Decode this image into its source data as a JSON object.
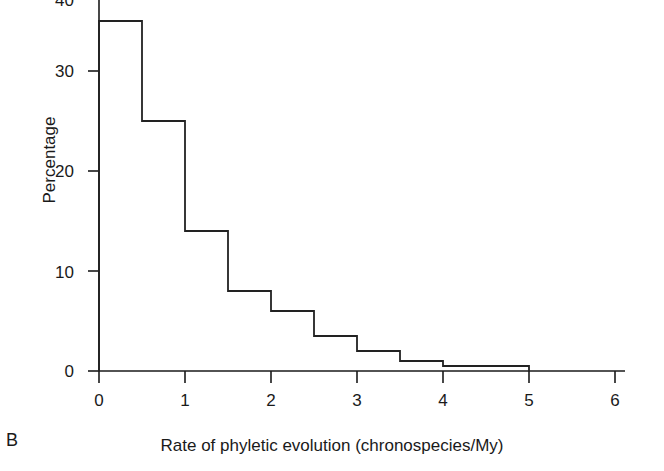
{
  "panel": {
    "label": "B"
  },
  "chart_data": {
    "type": "bar",
    "title": "",
    "subtitle": "",
    "xlabel": "Rate of phyletic evolution (chronospecies/My)",
    "ylabel": "Percentage",
    "style": "step-histogram-outline",
    "grid": false,
    "legend": null,
    "xlim": [
      0,
      6
    ],
    "ylim": [
      0,
      40
    ],
    "xticks": [
      "0",
      "1",
      "2",
      "3",
      "4",
      "5",
      "6"
    ],
    "xtick_values": [
      0,
      1,
      2,
      3,
      4,
      5,
      6
    ],
    "yticks": [
      "0",
      "10",
      "20",
      "30",
      "40"
    ],
    "ytick_values": [
      0,
      10,
      20,
      30,
      40
    ],
    "ytick_top_clipped": true,
    "bin_width": 0.5,
    "bin_edges": [
      0,
      0.5,
      1,
      1.5,
      2,
      2.5,
      3,
      3.5,
      4,
      4.5,
      5
    ],
    "categories": [
      "0-0.5",
      "0.5-1",
      "1-1.5",
      "1.5-2",
      "2-2.5",
      "2.5-3",
      "3-3.5",
      "3.5-4",
      "4-4.5",
      "4.5-5"
    ],
    "values": [
      35,
      25,
      14,
      8,
      6,
      3.5,
      2,
      1,
      0.5,
      0.5
    ],
    "line_color": "#222222",
    "fill_color": "none",
    "axis_color": "#1a1a1a"
  }
}
